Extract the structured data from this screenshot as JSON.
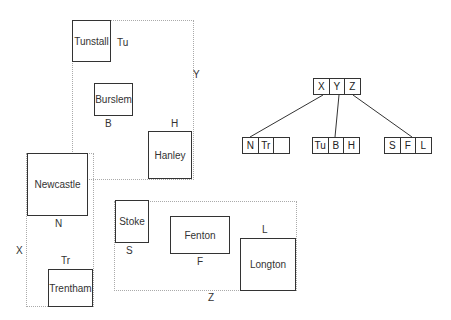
{
  "regions": [
    {
      "id": "X",
      "label": "X"
    },
    {
      "id": "Y",
      "label": "Y"
    },
    {
      "id": "Z",
      "label": "Z"
    }
  ],
  "places": {
    "tunstall": {
      "name": "Tunstall",
      "abbr": "Tu"
    },
    "burslem": {
      "name": "Burslem",
      "abbr": "B"
    },
    "hanley": {
      "name": "Hanley",
      "abbr": "H"
    },
    "newcastle": {
      "name": "Newcastle",
      "abbr": "N"
    },
    "trentham": {
      "name": "Trentham",
      "abbr": "Tr"
    },
    "stoke": {
      "name": "Stoke",
      "abbr": "S"
    },
    "fenton": {
      "name": "Fenton",
      "abbr": "F"
    },
    "longton": {
      "name": "Longton",
      "abbr": "L"
    }
  },
  "tree": {
    "root": [
      "X",
      "Y",
      "Z"
    ],
    "leaves": [
      [
        "N",
        "Tr",
        ""
      ],
      [
        "Tu",
        "B",
        "H"
      ],
      [
        "S",
        "F",
        "L"
      ]
    ]
  }
}
